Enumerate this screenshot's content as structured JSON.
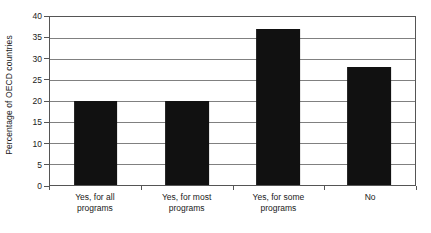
{
  "chart_data": {
    "type": "bar",
    "title": "",
    "subtitle": "",
    "xlabel": "",
    "ylabel": "Percentage of OECD countries",
    "categories": [
      "Yes, for all programs",
      "Yes, for most programs",
      "Yes, for some programs",
      "No"
    ],
    "category_lines": [
      [
        "Yes, for all",
        "programs"
      ],
      [
        "Yes, for most",
        "programs"
      ],
      [
        "Yes, for some",
        "programs"
      ],
      [
        "No",
        ""
      ]
    ],
    "values": [
      20.0,
      20.1,
      37.2,
      28.2
    ],
    "ylim": [
      0,
      40
    ],
    "ytick_step": 5,
    "ytick_labels": [
      "0",
      "5",
      "10",
      "15",
      "20",
      "25",
      "30",
      "35",
      "40"
    ],
    "ytick_values": [
      0,
      5,
      10,
      15,
      20,
      25,
      30,
      35,
      40
    ],
    "grid": true,
    "grid_axis": "y",
    "legend": false,
    "legend_position": "none",
    "bar_color": "#111111",
    "grid_color": "#808080",
    "axis_color": "#555555",
    "background_color": "#ffffff",
    "text_color": "#1a1a1a"
  }
}
